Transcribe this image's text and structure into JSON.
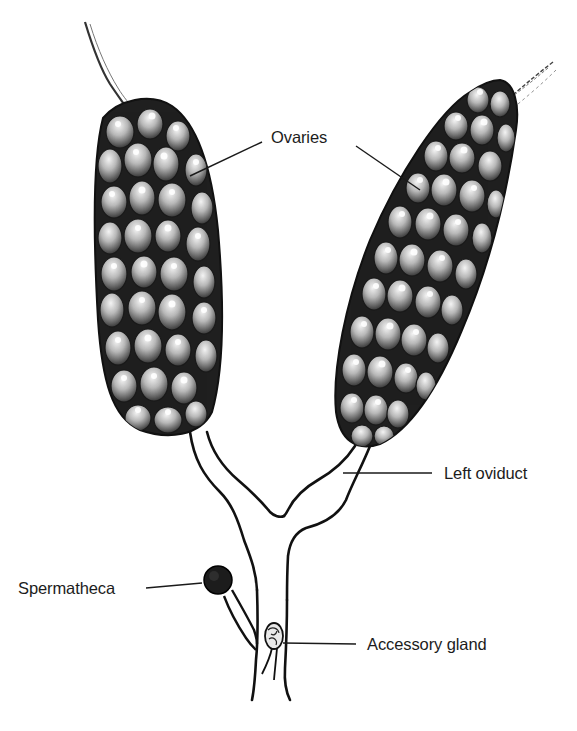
{
  "diagram": {
    "labels": {
      "ovaries": "Ovaries",
      "left_oviduct": "Left oviduct",
      "spermatheca": "Spermatheca",
      "accessory_gland": "Accessory gland"
    },
    "structures": [
      {
        "id": "left-ovary",
        "label_key": "ovaries"
      },
      {
        "id": "right-ovary",
        "label_key": "ovaries"
      },
      {
        "id": "left-oviduct",
        "label_key": "left_oviduct"
      },
      {
        "id": "common-oviduct",
        "label_key": null
      },
      {
        "id": "spermatheca",
        "label_key": "spermatheca"
      },
      {
        "id": "accessory-gland",
        "label_key": "accessory_gland"
      }
    ],
    "colors": {
      "ink": "#111111",
      "ovary_fill": "#2b2b2b",
      "egg_fill": "#bdbdbd",
      "egg_highlight": "#f2f2f2",
      "background": "#ffffff"
    }
  }
}
